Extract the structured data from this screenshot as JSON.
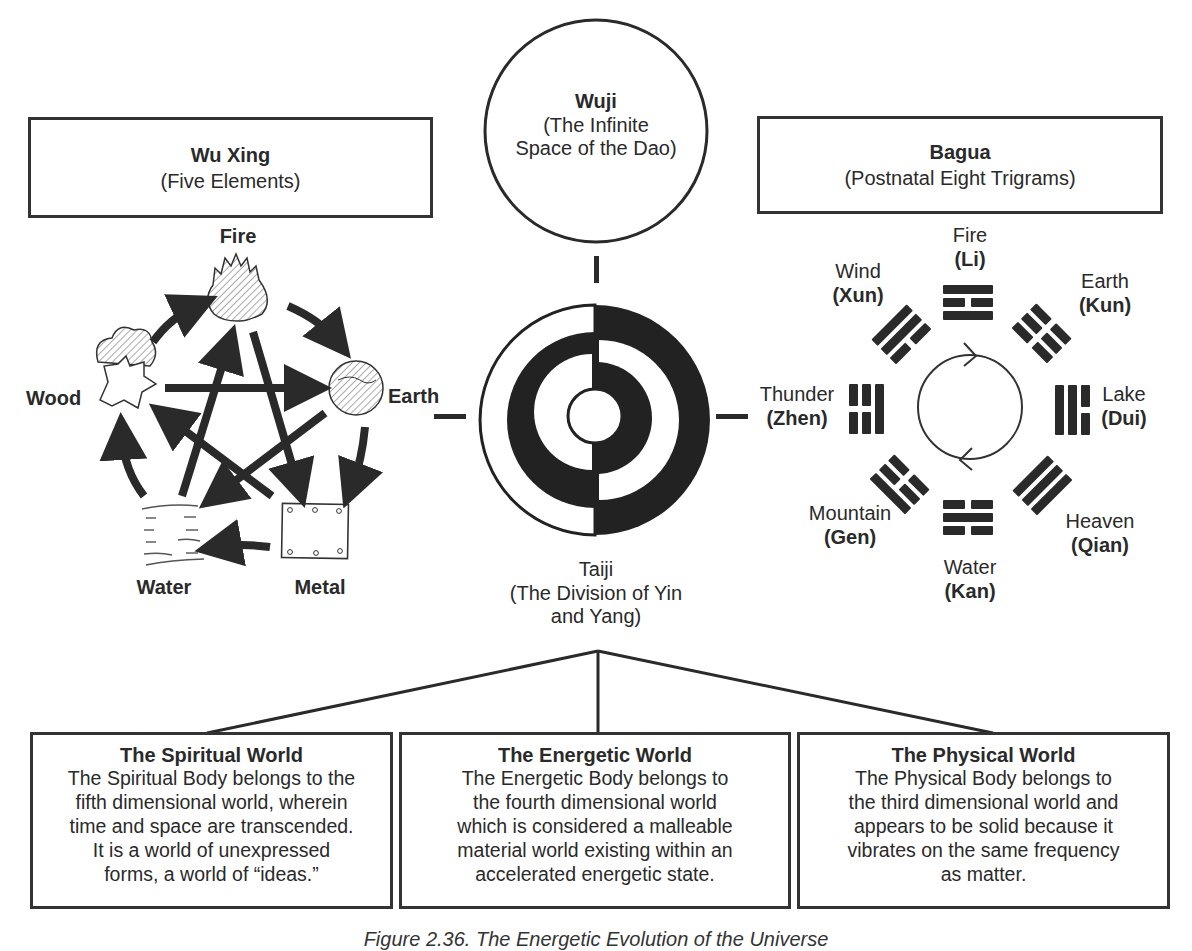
{
  "wu_xing": {
    "title": "Wu Xing",
    "subtitle": "(Five Elements)",
    "elements": {
      "fire": "Fire",
      "earth": "Earth",
      "metal": "Metal",
      "water": "Water",
      "wood": "Wood"
    }
  },
  "wuji": {
    "title": "Wuji",
    "line1": "(The Infinite",
    "line2": "Space of the Dao)"
  },
  "taiji": {
    "title": "Taiji",
    "line1": "(The Division of Yin",
    "line2": "and Yang)"
  },
  "bagua": {
    "title": "Bagua",
    "subtitle": "(Postnatal Eight Trigrams)",
    "trigrams": [
      {
        "name": "Fire",
        "pinyin": "(Li)"
      },
      {
        "name": "Earth",
        "pinyin": "(Kun)"
      },
      {
        "name": "Lake",
        "pinyin": "(Dui)"
      },
      {
        "name": "Heaven",
        "pinyin": "(Qian)"
      },
      {
        "name": "Water",
        "pinyin": "(Kan)"
      },
      {
        "name": "Mountain",
        "pinyin": "(Gen)"
      },
      {
        "name": "Thunder",
        "pinyin": "(Zhen)"
      },
      {
        "name": "Wind",
        "pinyin": "(Xun)"
      }
    ]
  },
  "worlds": [
    {
      "title": "The Spiritual World",
      "lines": [
        "The Spiritual Body belongs to the",
        "fifth dimensional world, wherein",
        "time and space are transcended.",
        "It is a world of unexpressed",
        "forms, a world of “ideas.”"
      ]
    },
    {
      "title": "The Energetic World",
      "lines": [
        "The Energetic Body belongs to",
        "the fourth dimensional world",
        "which is considered a malleable",
        "material world existing within an",
        "accelerated energetic state."
      ]
    },
    {
      "title": "The Physical World",
      "lines": [
        "The Physical Body belongs to",
        "the third dimensional world and",
        "appears to be solid because it",
        "vibrates on the same frequency",
        "as matter."
      ]
    }
  ],
  "caption": "Figure 2.36. The Energetic Evolution of the Universe",
  "colors": {
    "ink": "#2a2a2a",
    "background": "#ffffff"
  }
}
